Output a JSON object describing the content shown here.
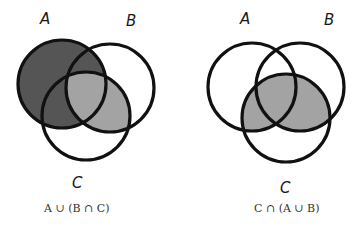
{
  "colors": {
    "outline": "#111111",
    "dark_fill": "#555555",
    "light_fill": "#a3a3a3",
    "background": "#ffffff"
  },
  "diagrams": [
    {
      "id": "left",
      "labels": {
        "A": "A",
        "B": "B",
        "C": "C"
      },
      "formula": "A ∪ (B ∩ C)",
      "shaded_regions": "A (dark) and B∩C (light)"
    },
    {
      "id": "right",
      "labels": {
        "A": "A",
        "B": "B",
        "C": "C"
      },
      "formula": "C ∩ (A ∪ B)",
      "shaded_regions": "C∩A and C∩B (light)"
    }
  ]
}
